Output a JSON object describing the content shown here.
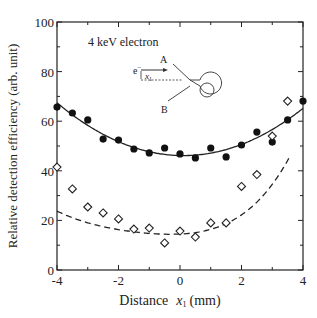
{
  "chart_data": {
    "type": "scatter",
    "title": "",
    "annotation": "4 keV electron",
    "xlabel": "Distance",
    "xlabel_var": "x",
    "xlabel_sub": "1",
    "xlabel_unit": "(mm)",
    "ylabel": "Relative detection efficiency (arb. unit)",
    "xlim": [
      -4,
      4
    ],
    "ylim": [
      0,
      100
    ],
    "xticks": [
      -4,
      -2,
      0,
      2,
      4
    ],
    "yticks": [
      0,
      20,
      40,
      60,
      80,
      100
    ],
    "grid": false,
    "series": [
      {
        "name": "filled circles (solid fit)",
        "marker": "filled-circle",
        "fit_line": "solid",
        "x": [
          -4,
          -3.5,
          -3,
          -2.5,
          -2,
          -1.5,
          -1,
          -0.5,
          0,
          0.5,
          1,
          1.5,
          2,
          2.5,
          3,
          3.5,
          4
        ],
        "values": [
          65.7,
          63.3,
          60.5,
          52.8,
          52.4,
          48.8,
          47.2,
          49.2,
          46.8,
          45.2,
          49.2,
          45.6,
          50.4,
          55.6,
          51.6,
          60.5,
          68.1
        ]
      },
      {
        "name": "open diamonds (dashed fit)",
        "marker": "open-diamond",
        "fit_line": "dashed",
        "x": [
          -4,
          -3.5,
          -3,
          -2.5,
          -2,
          -1.5,
          -1,
          -0.5,
          0,
          0.5,
          1,
          1.5,
          2,
          2.5,
          3,
          3.5
        ],
        "values": [
          41.5,
          32.7,
          25.4,
          23.0,
          20.6,
          16.5,
          16.9,
          10.9,
          15.7,
          13.3,
          19.0,
          19.0,
          33.7,
          38.5,
          54.0,
          68.1
        ]
      }
    ],
    "inset": {
      "beam_label": "e",
      "beam_sup": "−",
      "offset_label": "x",
      "offset_sub": "1",
      "electrode_a": "A",
      "electrode_b": "B"
    }
  }
}
